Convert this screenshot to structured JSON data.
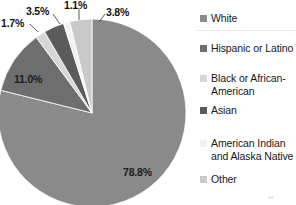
{
  "chart_data": {
    "type": "pie",
    "title": "",
    "subtitle": "",
    "xlabel": "",
    "ylabel": "",
    "grid": false,
    "legend_position": "right",
    "start_angle_deg": 0,
    "direction": "clockwise",
    "categories": [
      "White",
      "Hispanic or Latino",
      "Black or African-American",
      "Asian",
      "American Indian and Alaska Native",
      "Other"
    ],
    "values": [
      78.8,
      11.0,
      1.7,
      3.5,
      1.1,
      3.8
    ],
    "value_labels": [
      "78.8%",
      "11.0%",
      "1.7%",
      "3.5%",
      "1.1%",
      "3.8%"
    ],
    "units": "percent",
    "colors": [
      "#8a8a8a",
      "#6e6e6e",
      "#d6d6d6",
      "#5b5b5b",
      "#f2f2f2",
      "#c9c9c9"
    ],
    "slices": [
      {
        "label": "White",
        "value": 78.8,
        "display": "78.8%",
        "color": "#8a8a8a"
      },
      {
        "label": "Hispanic or Latino",
        "value": 11.0,
        "display": "11.0%",
        "color": "#6e6e6e"
      },
      {
        "label": "Black or African-American",
        "value": 1.7,
        "display": "1.7%",
        "color": "#d6d6d6"
      },
      {
        "label": "Asian",
        "value": 3.5,
        "display": "3.5%",
        "color": "#5b5b5b"
      },
      {
        "label": "American Indian and Alaska Native",
        "value": 1.1,
        "display": "1.1%",
        "color": "#f2f2f2"
      },
      {
        "label": "Other",
        "value": 3.8,
        "display": "3.8%",
        "color": "#c9c9c9"
      }
    ]
  },
  "legend": {
    "items": [
      {
        "label": "White",
        "color": "#8a8a8a"
      },
      {
        "label": "Hispanic or Latino",
        "color": "#6e6e6e"
      },
      {
        "label": "Black or African-\nAmerican",
        "color": "#d6d6d6"
      },
      {
        "label": "Asian",
        "color": "#5b5b5b"
      },
      {
        "label": "American Indian\nand Alaska Native",
        "color": "#f2f2f2"
      },
      {
        "label": "Other",
        "color": "#c9c9c9"
      }
    ]
  },
  "labels": {
    "white_pct": "78.8%",
    "hispanic_pct": "11.0%",
    "black_pct": "1.7%",
    "asian_pct": "3.5%",
    "amind_pct": "1.1%",
    "other_pct": "3.8%"
  },
  "colors": {
    "background": "#ffffff",
    "text": "#171717",
    "leader_line": "#5a5a5a"
  }
}
